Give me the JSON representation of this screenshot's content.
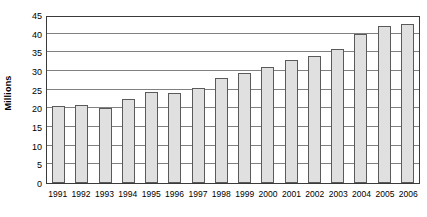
{
  "chart_data": {
    "type": "bar",
    "title": "",
    "xlabel": "",
    "ylabel": "Millions",
    "ylim": [
      0,
      45
    ],
    "yticks": [
      0,
      5,
      10,
      15,
      20,
      25,
      30,
      35,
      40,
      45
    ],
    "ytick_labels": [
      "0",
      "5",
      "10",
      "15",
      "20",
      "25",
      "30",
      "35",
      "40",
      "45"
    ],
    "grid": true,
    "legend": "none",
    "categories": [
      "1991",
      "1992",
      "1993",
      "1994",
      "1995",
      "1996",
      "1997",
      "1998",
      "1999",
      "2000",
      "2001",
      "2002",
      "2003",
      "2004",
      "2005",
      "2006"
    ],
    "values": [
      20.5,
      21,
      20,
      22.5,
      24.5,
      24,
      25.5,
      28,
      29.5,
      31,
      33,
      34,
      36,
      40,
      42,
      42.5
    ],
    "bar_fill_color": "#e0e0e0",
    "bar_border_color": "#5a5a5a",
    "gridline_color": "#808080",
    "axis_color": "#3a3a3a",
    "background_color": "#ffffff"
  }
}
